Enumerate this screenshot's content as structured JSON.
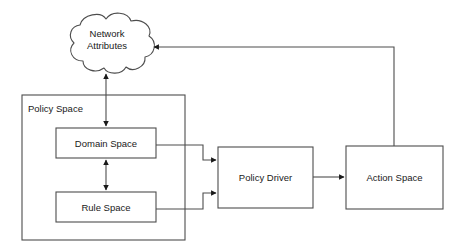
{
  "diagram": {
    "type": "block-diagram",
    "background_color": "#ffffff",
    "stroke_color": "#4d4d4d",
    "text_color": "#1a1a1a",
    "nodes": [
      {
        "id": "network-attributes",
        "label_line1": "Network",
        "label_line2": "Attributes",
        "shape": "cloud"
      },
      {
        "id": "policy-space",
        "label": "Policy Space",
        "shape": "container-rectangle"
      },
      {
        "id": "domain-space",
        "label": "Domain Space",
        "shape": "rectangle"
      },
      {
        "id": "rule-space",
        "label": "Rule Space",
        "shape": "rectangle"
      },
      {
        "id": "policy-driver",
        "label": "Policy Driver",
        "shape": "rectangle"
      },
      {
        "id": "action-space",
        "label": "Action Space",
        "shape": "rectangle"
      }
    ],
    "edges": [
      {
        "id": "network-attributes-domain-space",
        "from": "network-attributes",
        "to": "domain-space",
        "direction": "bidirectional"
      },
      {
        "id": "domain-space-rule-space",
        "from": "domain-space",
        "to": "rule-space",
        "direction": "bidirectional"
      },
      {
        "id": "domain-space-policy-driver",
        "from": "domain-space",
        "to": "policy-driver",
        "direction": "forward"
      },
      {
        "id": "rule-space-policy-driver",
        "from": "rule-space",
        "to": "policy-driver",
        "direction": "forward"
      },
      {
        "id": "policy-driver-action-space",
        "from": "policy-driver",
        "to": "action-space",
        "direction": "forward"
      },
      {
        "id": "action-space-network-attributes",
        "from": "action-space",
        "to": "network-attributes",
        "direction": "forward"
      }
    ]
  }
}
